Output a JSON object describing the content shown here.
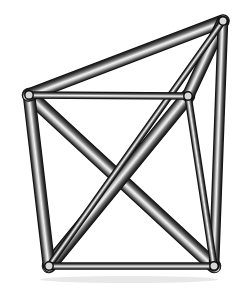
{
  "scene": {
    "title": "3D Truss Structure",
    "description": "Shaded cylindrical strut wireframe with pin joints",
    "width": 239,
    "height": 288,
    "background_color": "#ffffff"
  },
  "style": {
    "strut_edge_dark": "#1a1a1a",
    "strut_mid_gray": "#6e6e6e",
    "strut_highlight": "#f2f2f2",
    "strut_shadow": "#2a2a2a",
    "outline_color": "#111111",
    "node_fill": "#d8d8d8",
    "node_stroke": "#0d0d0d",
    "node_radius": 4.2
  },
  "nodes": [
    {
      "id": "n-top-left",
      "label": "A",
      "x": 29,
      "y": 95
    },
    {
      "id": "n-top-right",
      "label": "B",
      "x": 223,
      "y": 21
    },
    {
      "id": "n-mid-right",
      "label": "C",
      "x": 188,
      "y": 96
    },
    {
      "id": "n-bottom-left",
      "label": "D",
      "x": 49,
      "y": 266
    },
    {
      "id": "n-bottom-right",
      "label": "E",
      "x": 214,
      "y": 266
    }
  ],
  "struts": [
    {
      "id": "s-tl-br",
      "name": "strut-topleft-bottomright",
      "from": "n-top-left",
      "to": "n-bottom-right",
      "width": 13,
      "order": 1
    },
    {
      "id": "s-mr-bl",
      "name": "strut-midright-bottomleft",
      "from": "n-mid-right",
      "to": "n-bottom-left",
      "width": 13,
      "order": 2
    },
    {
      "id": "s-tl-bl",
      "name": "strut-left-post",
      "from": "n-top-left",
      "to": "n-bottom-left",
      "width": 11,
      "order": 3
    },
    {
      "id": "s-tl-tr",
      "name": "strut-topleft-topright",
      "from": "n-top-left",
      "to": "n-top-right",
      "width": 12,
      "order": 4
    },
    {
      "id": "s-tr-mr",
      "name": "strut-topright-midright",
      "from": "n-top-right",
      "to": "n-mid-right",
      "width": 11,
      "order": 5
    },
    {
      "id": "s-tr-br",
      "name": "strut-right-post",
      "from": "n-top-right",
      "to": "n-bottom-right",
      "width": 9,
      "order": 6
    },
    {
      "id": "s-tr-bl",
      "name": "strut-topright-bottomleft",
      "from": "n-top-right",
      "to": "n-bottom-left",
      "width": 5,
      "order": 7
    },
    {
      "id": "s-tl-mr",
      "name": "strut-top-chord",
      "from": "n-top-left",
      "to": "n-mid-right",
      "width": 6,
      "order": 8
    },
    {
      "id": "s-bl-br",
      "name": "strut-bottom-chord",
      "from": "n-bottom-left",
      "to": "n-bottom-right",
      "width": 6,
      "order": 9
    },
    {
      "id": "s-mr-br",
      "name": "strut-midright-bottomright",
      "from": "n-mid-right",
      "to": "n-bottom-right",
      "width": 6,
      "order": 10
    }
  ],
  "shadow": {
    "name": "ground-shadow",
    "x": 40,
    "y": 276,
    "width": 178,
    "height": 7,
    "color": "#e8e8e8"
  }
}
